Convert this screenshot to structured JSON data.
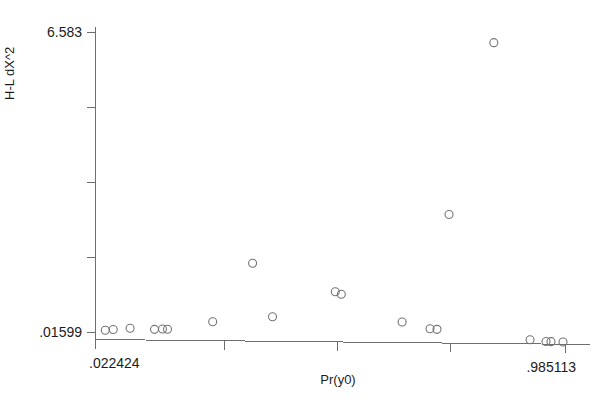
{
  "chart_data": {
    "type": "scatter",
    "title": "",
    "xlabel": "Pr(y0)",
    "ylabel": "H-L dX^2",
    "xlim": [
      0.022424,
      0.985113
    ],
    "ylim": [
      0.01599,
      6.583
    ],
    "x_tick_labels": [
      "022424",
      "985113"
    ],
    "x_tick_label_min": ".022424",
    "x_tick_label_max": ".985113",
    "y_tick_label_min": ".01599",
    "y_tick_label_max": "6.583",
    "x_tick_count": 5,
    "y_tick_count": 5,
    "grid": false,
    "legend": false,
    "marker": "open-circle",
    "marker_color": "#757575",
    "axis_color": "#6e6e6e",
    "background": "#ffffff",
    "points": [
      {
        "x": 0.0424,
        "y": 0.07
      },
      {
        "x": 0.0587,
        "y": 0.092
      },
      {
        "x": 0.0933,
        "y": 0.129
      },
      {
        "x": 0.1433,
        "y": 0.118
      },
      {
        "x": 0.1597,
        "y": 0.129
      },
      {
        "x": 0.1699,
        "y": 0.129
      },
      {
        "x": 0.2625,
        "y": 0.316
      },
      {
        "x": 0.3442,
        "y": 1.62
      },
      {
        "x": 0.385,
        "y": 0.459
      },
      {
        "x": 0.5136,
        "y": 1.043
      },
      {
        "x": 0.5259,
        "y": 0.992
      },
      {
        "x": 0.6504,
        "y": 0.418
      },
      {
        "x": 0.7076,
        "y": 0.284
      },
      {
        "x": 0.7219,
        "y": 0.276
      },
      {
        "x": 0.7465,
        "y": 2.797
      },
      {
        "x": 0.8383,
        "y": 6.583
      },
      {
        "x": 0.9125,
        "y": 0.101
      },
      {
        "x": 0.9452,
        "y": 0.07
      },
      {
        "x": 0.9554,
        "y": 0.07
      },
      {
        "x": 0.98,
        "y": 0.07
      }
    ]
  },
  "axes": {
    "y_label": "H-L dX^2",
    "x_label": "Pr(y0)",
    "y_max_label": "6.583",
    "y_min_label": ".01599",
    "x_min_label": ".022424",
    "x_max_label": ".985113"
  }
}
